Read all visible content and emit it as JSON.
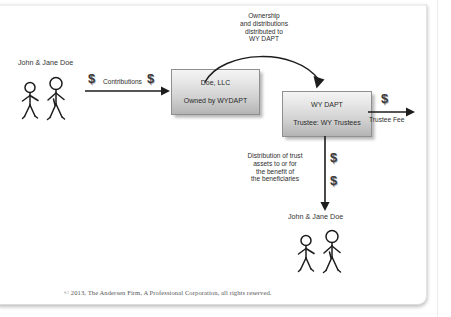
{
  "document": {
    "copyright": "© 2013, The Andersen Firm, A Professional Corporation, all rights reserved."
  },
  "diagram": {
    "type": "flow-diagram",
    "nodes": [
      {
        "id": "grantors-top",
        "kind": "people",
        "label": "John & Jane Doe",
        "figures": 2
      },
      {
        "id": "doe-llc",
        "kind": "box",
        "line1": "Doe, LLC",
        "line2": "Owned by WYDAPT"
      },
      {
        "id": "wy-dapt",
        "kind": "box",
        "line1": "WY DAPT",
        "line2": "Trustee: WY Trustees"
      },
      {
        "id": "beneficiaries-bottom",
        "kind": "people",
        "label": "John & Jane Doe",
        "figures": 2
      }
    ],
    "edges": [
      {
        "id": "contributions",
        "from": "grantors-top",
        "to": "doe-llc",
        "label": "Contributions",
        "shape": "straight-right",
        "money_marks": 2
      },
      {
        "id": "ownership-distributions",
        "from": "doe-llc",
        "to": "wy-dapt",
        "label": "Ownership\nand distributions\ndistributed to\nWY DAPT",
        "shape": "arc-over",
        "money_marks": 0
      },
      {
        "id": "trustee-fee",
        "from": "wy-dapt",
        "to": "external",
        "label": "Trustee Fee",
        "shape": "straight-right",
        "money_marks": 1
      },
      {
        "id": "trust-distribution",
        "from": "wy-dapt",
        "to": "beneficiaries-bottom",
        "label": "Distribution of trust\nassets to or for\nthe benefit of\nthe beneficiaries",
        "shape": "straight-down",
        "money_marks": 2
      }
    ],
    "glyphs": {
      "money": "$"
    }
  },
  "colors": {
    "box_fill_top": "#f4f4f4",
    "box_fill_bottom": "#b4b4b4",
    "box_border": "#8f8f8f",
    "ink": "#2b2b2b",
    "line": "#1d1d1d",
    "copyright_text": "#59595b",
    "page_background": "#ffffff"
  }
}
